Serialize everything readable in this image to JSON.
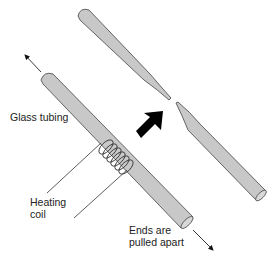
{
  "figure": {
    "type": "diagram",
    "labels": {
      "glass_tubing": "Glass tubing",
      "heating_coil_line1": "Heating",
      "heating_coil_line2": "coil",
      "ends_line1": "Ends are",
      "ends_line2": "pulled apart"
    },
    "colors": {
      "tube_fill": "#c8c8c8",
      "tube_stroke": "#555555",
      "arrow_fill": "#000000",
      "text": "#222222"
    },
    "icons": {
      "process_arrow": "bold-arrow-up-right-icon",
      "pull_arrow_up": "arrow-up-left-icon",
      "pull_arrow_down": "arrow-down-right-icon",
      "coil": "coil-icon"
    }
  }
}
